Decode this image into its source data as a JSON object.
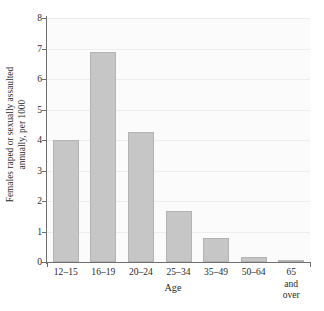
{
  "chart_data": {
    "type": "bar",
    "title": "",
    "subtitle": "",
    "xlabel": "Age",
    "ylabel": "Females raped or sexually assaulted annually, per 1000",
    "ylabel_lines": [
      "Females raped or sexually assaulted",
      "annually, per 1000"
    ],
    "categories": [
      "12–15",
      "16–19",
      "20–24",
      "25–34",
      "35–49",
      "50–64",
      "65 and over"
    ],
    "category_display": [
      "12–15",
      "16–19",
      "20–24",
      "25–34",
      "35–49",
      "50–64",
      "65 and\nover"
    ],
    "values": [
      4.0,
      6.87,
      4.27,
      1.67,
      0.79,
      0.17,
      0.07
    ],
    "ylim": [
      0,
      8
    ],
    "ytick_values": [
      0,
      1,
      2,
      3,
      4,
      5,
      6,
      7,
      8
    ],
    "ytick_labels": [
      "0",
      "1",
      "2",
      "3",
      "4",
      "5",
      "6",
      "7",
      "8"
    ],
    "ytick_step": 1,
    "grid": true,
    "grid_axis": "y",
    "legend": false,
    "legend_position": "none",
    "bar_color": "#c6c6c6",
    "bar_edge_color": "#b3b3b3",
    "axis_color": "#6e6e6e",
    "grid_color": "#ededed",
    "plot_background": "#fbfbfb",
    "figure_background": "#ffffff",
    "text_color": "#2b2b2b"
  }
}
